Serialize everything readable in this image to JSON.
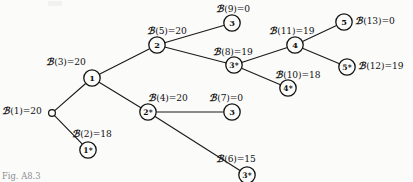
{
  "figure": {
    "caption": "Fig. A8.3",
    "ink_color": "#131313",
    "paper_color": "#fbfbfa"
  },
  "nodes": [
    {
      "id": "root",
      "label": "",
      "x": 52,
      "y": 113,
      "r": 3.4,
      "kind": "open"
    },
    {
      "id": "n1",
      "label": "1",
      "x": 92,
      "y": 78,
      "r": 8.2,
      "kind": "circle"
    },
    {
      "id": "n1s",
      "label": "1*",
      "x": 88,
      "y": 150,
      "r": 8.2,
      "kind": "circle"
    },
    {
      "id": "n2",
      "label": "2",
      "x": 157,
      "y": 45,
      "r": 8.2,
      "kind": "circle"
    },
    {
      "id": "n2s",
      "label": "2*",
      "x": 148,
      "y": 112,
      "r": 8.2,
      "kind": "circle"
    },
    {
      "id": "n3top",
      "label": "3",
      "x": 232,
      "y": 23,
      "r": 8.2,
      "kind": "circle"
    },
    {
      "id": "n3s",
      "label": "3*",
      "x": 234,
      "y": 65,
      "r": 8.2,
      "kind": "circle"
    },
    {
      "id": "n3low",
      "label": "3",
      "x": 232,
      "y": 112,
      "r": 8.2,
      "kind": "circle"
    },
    {
      "id": "n3sbot",
      "label": "3*",
      "x": 247,
      "y": 175,
      "r": 8.2,
      "kind": "circle"
    },
    {
      "id": "n4",
      "label": "4",
      "x": 295,
      "y": 45,
      "r": 8.2,
      "kind": "circle"
    },
    {
      "id": "n4s",
      "label": "4*",
      "x": 288,
      "y": 88,
      "r": 8.2,
      "kind": "circle"
    },
    {
      "id": "n5",
      "label": "5",
      "x": 344,
      "y": 22,
      "r": 8.2,
      "kind": "circle"
    },
    {
      "id": "n5s",
      "label": "5*",
      "x": 347,
      "y": 67,
      "r": 8.2,
      "kind": "circle"
    }
  ],
  "edges": [
    {
      "from": "root",
      "to": "n1"
    },
    {
      "from": "root",
      "to": "n1s"
    },
    {
      "from": "n1",
      "to": "n2"
    },
    {
      "from": "n1",
      "to": "n2s"
    },
    {
      "from": "n2",
      "to": "n3top"
    },
    {
      "from": "n2",
      "to": "n3s"
    },
    {
      "from": "n2s",
      "to": "n3low"
    },
    {
      "from": "n2s",
      "to": "n3sbot"
    },
    {
      "from": "n3s",
      "to": "n4"
    },
    {
      "from": "n3s",
      "to": "n4s"
    },
    {
      "from": "n4",
      "to": "n5"
    },
    {
      "from": "n4",
      "to": "n5s"
    }
  ],
  "bounds": [
    {
      "key": "b1",
      "sym": "ℬ",
      "arg": "(1)",
      "eq": "=20",
      "x": 2,
      "y": 106,
      "node": "root"
    },
    {
      "key": "b2",
      "sym": "ℬ",
      "arg": "(2)",
      "eq": "=18",
      "x": 72,
      "y": 129,
      "node": "n1s"
    },
    {
      "key": "b3",
      "sym": "ℬ",
      "arg": "(3)",
      "eq": "=20",
      "x": 46,
      "y": 57,
      "node": "n1"
    },
    {
      "key": "b4",
      "sym": "ℬ",
      "arg": "(4)",
      "eq": "=20",
      "x": 148,
      "y": 93,
      "node": "n2s"
    },
    {
      "key": "b5",
      "sym": "ℬ",
      "arg": "(5)",
      "eq": "=20",
      "x": 147,
      "y": 26,
      "node": "n2"
    },
    {
      "key": "b6",
      "sym": "ℬ",
      "arg": "(6)",
      "eq": "=15",
      "x": 216,
      "y": 154,
      "node": "n3sbot"
    },
    {
      "key": "b7",
      "sym": "ℬ",
      "arg": "(7)",
      "eq": "=0",
      "x": 209,
      "y": 93,
      "node": "n3low"
    },
    {
      "key": "b8",
      "sym": "ℬ",
      "arg": "(8)",
      "eq": "=19",
      "x": 213,
      "y": 47,
      "node": "n3s"
    },
    {
      "key": "b9",
      "sym": "ℬ",
      "arg": "(9)",
      "eq": "=0",
      "x": 216,
      "y": 4,
      "node": "n3top"
    },
    {
      "key": "b10",
      "sym": "ℬ",
      "arg": "(10)",
      "eq": "=18",
      "x": 275,
      "y": 70,
      "node": "n4s"
    },
    {
      "key": "b11",
      "sym": "ℬ",
      "arg": "(11)",
      "eq": "=19",
      "x": 269,
      "y": 26,
      "node": "n4"
    },
    {
      "key": "b12",
      "sym": "ℬ",
      "arg": "(12)",
      "eq": "=19",
      "x": 358,
      "y": 61,
      "node": "n5s"
    },
    {
      "key": "b13",
      "sym": "ℬ",
      "arg": "(13)",
      "eq": "=0",
      "x": 355,
      "y": 16,
      "node": "n5"
    }
  ]
}
